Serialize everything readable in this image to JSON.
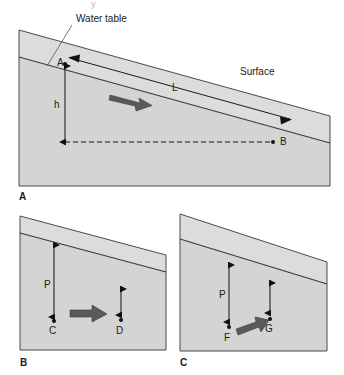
{
  "figure": {
    "title_fragment": "y",
    "panels": [
      {
        "id": "A",
        "panel_label": "A",
        "labels": {
          "water_table": "Water table",
          "surface": "Surface",
          "point_upper": "A",
          "point_lower": "B",
          "head_drop": "h",
          "flow_length": "L"
        }
      },
      {
        "id": "B",
        "panel_label": "B",
        "labels": {
          "long_arrow": "P",
          "point_left": "C",
          "point_right": "D"
        }
      },
      {
        "id": "C",
        "panel_label": "C",
        "labels": {
          "long_arrow": "P",
          "point_left": "F",
          "point_right": "G"
        }
      }
    ],
    "colors": {
      "block_fill": "#d4d4d4",
      "block_fill_light": "#dcdcdc",
      "block_fill_dark": "#c9c9c9",
      "outline": "#4a4a4a",
      "line": "#3a3a3a",
      "flow_arrow": "#5a5a5a",
      "text": "#1a1a1a",
      "background": "#ffffff"
    }
  }
}
